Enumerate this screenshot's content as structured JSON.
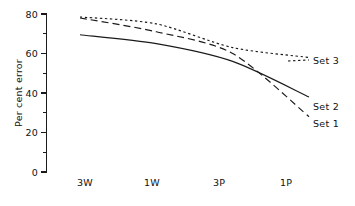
{
  "chart_data": {
    "type": "line",
    "title": "",
    "xlabel": "",
    "ylabel": "Per cent error",
    "categories": [
      "3W",
      "1W",
      "3P",
      "1P"
    ],
    "x": [
      0,
      1,
      2,
      3
    ],
    "xlim": [
      -0.22,
      3.25
    ],
    "ylim": [
      0,
      82
    ],
    "yticks_major": [
      0,
      20,
      40,
      60,
      80
    ],
    "yticks_minor": [
      10,
      30,
      50,
      70
    ],
    "ytick_labels": [
      "0",
      "20",
      "40",
      "60",
      "80"
    ],
    "grid": false,
    "legend_position": "right-inline",
    "series": [
      {
        "name": "Set 1",
        "style": "dashed",
        "values": [
          78,
          71,
          60,
          28
        ]
      },
      {
        "name": "Set 2",
        "style": "solid",
        "values": [
          69.5,
          65,
          56,
          38
        ]
      },
      {
        "name": "Set 3",
        "style": "dotted",
        "values": [
          78.5,
          75,
          63,
          58
        ]
      }
    ],
    "annotations": [
      "Set 3",
      "Set 2",
      "Set 1"
    ]
  },
  "legend": {
    "items": [
      {
        "label": "Set 3",
        "style": "dotted"
      },
      {
        "label": "Set 2",
        "style": "solid"
      },
      {
        "label": "Set 1",
        "style": "dashed"
      }
    ]
  },
  "axes": {
    "y_title": "Per cent error",
    "y_labels": [
      "80",
      "60",
      "40",
      "20",
      "0"
    ],
    "x_labels": [
      "3W",
      "1W",
      "3P",
      "1P"
    ]
  },
  "colors": {
    "ink": "#1a1a1a",
    "background": "#ffffff"
  }
}
